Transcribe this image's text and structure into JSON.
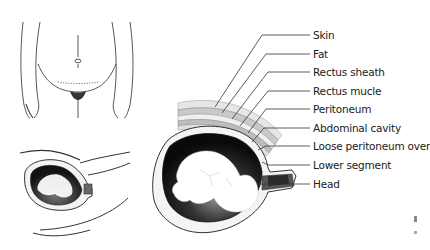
{
  "figure": {
    "panels": [
      {
        "id": "torso-front-view",
        "description": "Front view of pregnant abdomen with dotted lower transverse incision line"
      },
      {
        "id": "uterus-side-small",
        "description": "Small sagittal view of uterus with fetus"
      },
      {
        "id": "uterus-layers-detail",
        "description": "Enlarged sagittal section showing abdominal wall layers over fetus"
      }
    ],
    "labels": [
      {
        "text": "Skin",
        "y": 35
      },
      {
        "text": "Fat",
        "y": 54
      },
      {
        "text": "Rectus sheath",
        "y": 72
      },
      {
        "text": "Rectus mucle",
        "y": 91
      },
      {
        "text": "Peritoneum",
        "y": 109
      },
      {
        "text": "Abdominal cavity",
        "y": 128
      },
      {
        "text": "Loose peritoneum over",
        "y": 146
      },
      {
        "text": "Lower segment",
        "y": 165
      },
      {
        "text": "Head",
        "y": 184
      }
    ],
    "colors": {
      "line": "#333333",
      "layer_light": "#d9d9d9",
      "layer_mid": "#b5b5b5",
      "cavity": "#1a1a1a",
      "fetus": "#ffffff"
    }
  }
}
